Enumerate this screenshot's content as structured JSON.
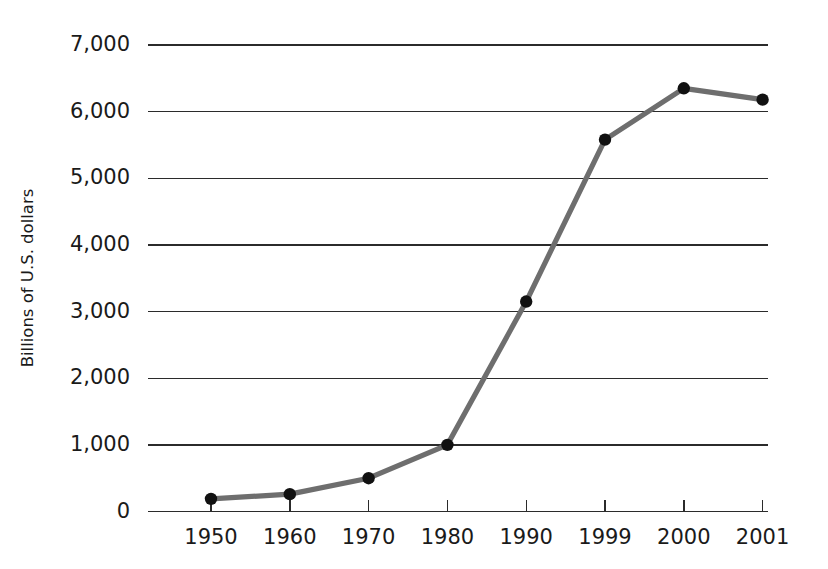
{
  "chart_data": {
    "type": "line",
    "title": "",
    "subtitle": "",
    "xlabel": "",
    "ylabel": "Billions of U.S. dollars",
    "categories": [
      "1950",
      "1960",
      "1970",
      "1980",
      "1990",
      "1999",
      "2000",
      "2001"
    ],
    "values": [
      190,
      260,
      500,
      1000,
      3150,
      5580,
      6350,
      6180
    ],
    "series": [
      {
        "name": "",
        "values": [
          190,
          260,
          500,
          1000,
          3150,
          5580,
          6350,
          6180
        ]
      }
    ],
    "ylim": [
      0,
      7000
    ],
    "yticks": [
      0,
      1000,
      2000,
      3000,
      4000,
      5000,
      6000,
      7000
    ],
    "ytick_labels": [
      "0",
      "1,000",
      "2,000",
      "3,000",
      "4,000",
      "5,000",
      "6,000",
      "7,000"
    ],
    "xtick_labels": [
      "1950",
      "1960",
      "1970",
      "1980",
      "1990",
      "1999",
      "2000",
      "2001"
    ],
    "grid": "horizontal",
    "legend": "none",
    "markers": "filled-circle",
    "line_color": "#6e6e6e",
    "marker_color": "#111111",
    "grid_color": "#2b2b2b",
    "axis_color": "#2b2b2b",
    "text_color": "#1a1a1a",
    "background_color": "#ffffff",
    "annotations": []
  }
}
